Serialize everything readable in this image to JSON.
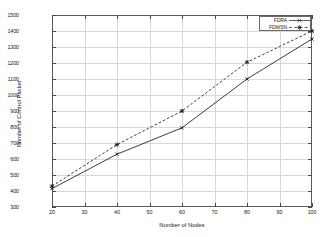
{
  "chart_data": {
    "type": "line",
    "title": "",
    "xlabel": "Number of Nodes",
    "ylabel": "Number of Control Packet",
    "x": [
      20,
      40,
      60,
      80,
      100
    ],
    "xlim": [
      20,
      100
    ],
    "ylim": [
      300,
      1500
    ],
    "xticks": [
      20,
      30,
      40,
      50,
      60,
      70,
      80,
      90,
      100
    ],
    "yticks": [
      300,
      400,
      500,
      600,
      700,
      800,
      900,
      1000,
      1100,
      1200,
      1300,
      1400,
      1500
    ],
    "grid": true,
    "legend_position": "top-right",
    "series": [
      {
        "name": "FDRA",
        "values": [
          415,
          630,
          795,
          1100,
          1350
        ],
        "linestyle": "solid",
        "marker": "cross",
        "color": "#1a1a1a"
      },
      {
        "name": "FDWSN",
        "values": [
          430,
          690,
          900,
          1205,
          1400
        ],
        "linestyle": "dashed",
        "marker": "star",
        "color": "#1a1a1a"
      }
    ]
  },
  "legend": {
    "entries": [
      {
        "label": "FDRA"
      },
      {
        "label": "FDWSN"
      }
    ]
  },
  "axes": {
    "y_tick_labels": [
      "300",
      "400",
      "500",
      "600",
      "700",
      "800",
      "900",
      "1000",
      "1100",
      "1200",
      "1300",
      "1400",
      "1500"
    ],
    "x_tick_labels": [
      "20",
      "30",
      "40",
      "50",
      "60",
      "70",
      "80",
      "90",
      "100"
    ],
    "x_title": "Number of Nodes",
    "y_title": "Number of Control Packet"
  }
}
